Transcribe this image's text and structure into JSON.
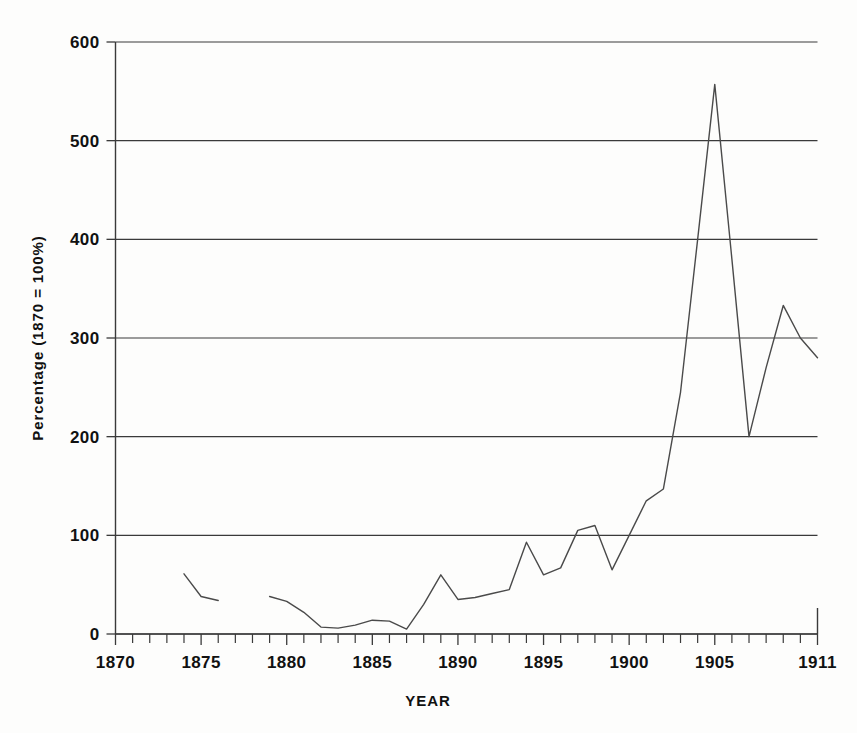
{
  "chart_data": {
    "type": "line",
    "title": "",
    "subtitle": "",
    "xlabel": "YEAR",
    "ylabel": "Percentage (1870 = 100%)",
    "xlim": [
      1870,
      1911
    ],
    "ylim": [
      0,
      600
    ],
    "grid": true,
    "legend": null,
    "y_ticks": [
      0,
      100,
      200,
      300,
      400,
      500,
      600
    ],
    "y_tick_labels": [
      "0",
      "100",
      "200",
      "300",
      "400",
      "500",
      "600"
    ],
    "x_tick_labels": [
      "1870",
      "1875",
      "1880",
      "1885",
      "1890",
      "1895",
      "1900",
      "1905",
      "1911"
    ],
    "x_tick_label_values": [
      1870,
      1875,
      1880,
      1885,
      1890,
      1895,
      1900,
      1905,
      1911
    ],
    "x_minor_tick_step": 1,
    "line_color": "#4a4a4a",
    "series": [
      {
        "name": "Percentage (1870 = 100%)",
        "segments": [
          {
            "x": [
              1874,
              1875,
              1876
            ],
            "y": [
              61,
              38,
              34
            ]
          },
          {
            "x": [
              1879,
              1880,
              1881,
              1882,
              1883,
              1884,
              1885,
              1886,
              1887,
              1888,
              1889,
              1890,
              1891,
              1892,
              1893,
              1894,
              1895,
              1896,
              1897,
              1898,
              1899,
              1900,
              1901,
              1902,
              1903,
              1904,
              1905,
              1906,
              1907,
              1908,
              1909,
              1910,
              1911
            ],
            "y": [
              38,
              33,
              22,
              7,
              6,
              9,
              14,
              13,
              5,
              30,
              60,
              35,
              37,
              41,
              45,
              93,
              60,
              67,
              105,
              110,
              65,
              100,
              135,
              147,
              245,
              400,
              557,
              380,
              200,
              270,
              333,
              300,
              280
            ]
          }
        ]
      }
    ]
  },
  "axes": {
    "x_axis_name": "year-axis",
    "y_axis_name": "percentage-axis"
  }
}
